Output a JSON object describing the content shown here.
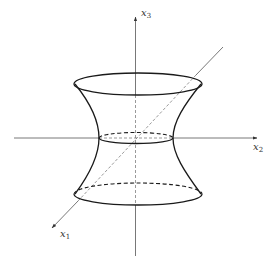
{
  "figure": {
    "axes": {
      "x1": {
        "label": "x",
        "subscript": "1"
      },
      "x2": {
        "label": "x",
        "subscript": "2"
      },
      "x3": {
        "label": "x",
        "subscript": "3"
      }
    },
    "colors": {
      "stroke": "#1a1a1a",
      "axis": "#333333",
      "background": "#ffffff"
    }
  }
}
